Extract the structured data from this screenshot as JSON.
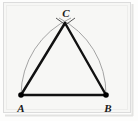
{
  "figure": {
    "background_color": "#f7f7f5",
    "frame_color": "#dcdcdc",
    "inner_frame_color": "#e8e8e6",
    "triangle_color": "#111111",
    "arc_color": "#9a9a9a",
    "vertex_dot_color": "#000000",
    "label_color": "#1a1a1a",
    "vertices": [
      {
        "id": "A",
        "label": "A",
        "x": 21,
        "y": 95,
        "label_x": 21,
        "label_y": 109
      },
      {
        "id": "B",
        "label": "B",
        "x": 106,
        "y": 95,
        "label_x": 107,
        "label_y": 109
      },
      {
        "id": "C",
        "label": "C",
        "x": 65,
        "y": 23,
        "label_x": 66,
        "label_y": 14
      }
    ],
    "sides": [
      {
        "name": "side-AB",
        "from": "A",
        "to": "B"
      },
      {
        "name": "side-AC",
        "from": "A",
        "to": "C"
      },
      {
        "name": "side-BC",
        "from": "B",
        "to": "C"
      }
    ],
    "arcs": [
      {
        "name": "arc-from-A",
        "center": "A",
        "radius": 85,
        "from_x": 21,
        "from_y": 95,
        "to_x": 71,
        "to_y": 18
      },
      {
        "name": "arc-from-B",
        "center": "B",
        "radius": 85,
        "from_x": 106,
        "from_y": 95,
        "to_x": 59,
        "to_y": 18
      }
    ],
    "tick_marks": [
      {
        "name": "arc-tick-left",
        "x1": 56,
        "y1": 18,
        "x2": 66,
        "y2": 25
      },
      {
        "name": "arc-tick-right",
        "x1": 74,
        "y1": 18,
        "x2": 64,
        "y2": 25
      }
    ],
    "line_widths": {
      "triangle": 2.4,
      "arc": 0.9,
      "tick": 1.0
    },
    "dot_radius": 2.6,
    "label_font_size": 11
  }
}
